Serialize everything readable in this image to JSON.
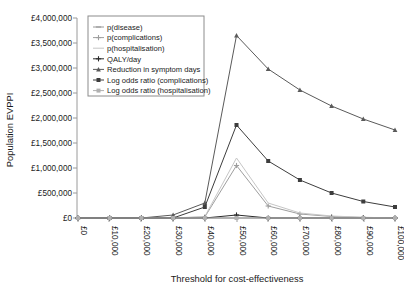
{
  "chart_data": {
    "type": "line",
    "title": "",
    "xlabel": "Threshold for cost-effectiveness",
    "ylabel": "Population EVPPI",
    "x": [
      0,
      10000,
      20000,
      30000,
      40000,
      50000,
      60000,
      70000,
      80000,
      90000,
      100000
    ],
    "categories": [
      "£0",
      "£10,000",
      "£20,000",
      "£30,000",
      "£40,000",
      "£50,000",
      "£60,000",
      "£70,000",
      "£80,000",
      "£90,000",
      "£100,000"
    ],
    "xtick_labels": [
      "£0",
      "£10,000",
      "£20,000",
      "£30,000",
      "£40,000",
      "£50,000",
      "£60,000",
      "£70,000",
      "£80,000",
      "£90,000",
      "£100,000"
    ],
    "ytick_labels": [
      "£0",
      "£500,000",
      "£1,000,000",
      "£1,500,000",
      "£2,000,000",
      "£2,500,000",
      "£3,000,000",
      "£3,500,000",
      "£4,000,000"
    ],
    "ytick_values": [
      0,
      500000,
      1000000,
      1500000,
      2000000,
      2500000,
      3000000,
      3500000,
      4000000
    ],
    "ylim": [
      0,
      4000000
    ],
    "xlim": [
      0,
      100000
    ],
    "grid": false,
    "legend_position": "upper-left-inside",
    "x_tick_label_rotation": 90,
    "series": [
      {
        "name": "p(disease)",
        "color": "#9a9a9a",
        "marker": "dash",
        "values": [
          0,
          0,
          0,
          0,
          0,
          0,
          0,
          0,
          0,
          0,
          0
        ]
      },
      {
        "name": "p(complications)",
        "color": "#9e9e9e",
        "marker": "plus",
        "values": [
          0,
          0,
          0,
          0,
          20000,
          1050000,
          240000,
          80000,
          30000,
          10000,
          0
        ]
      },
      {
        "name": "p(hospitalisation)",
        "color": "#c6c6c6",
        "marker": "none",
        "values": [
          0,
          0,
          0,
          0,
          30000,
          1200000,
          300000,
          100000,
          40000,
          15000,
          0
        ]
      },
      {
        "name": "QALY/day",
        "color": "#2b2b2b",
        "marker": "plus",
        "values": [
          0,
          0,
          0,
          0,
          0,
          60000,
          0,
          0,
          0,
          0,
          0
        ]
      },
      {
        "name": "Reduction in symptom days",
        "color": "#5a5a5a",
        "marker": "triangle",
        "values": [
          0,
          0,
          0,
          60000,
          300000,
          3650000,
          2980000,
          2560000,
          2240000,
          1980000,
          1760000
        ]
      },
      {
        "name": "Log odds ratio (complications)",
        "color": "#3d3d3d",
        "marker": "square",
        "values": [
          0,
          0,
          0,
          0,
          220000,
          1860000,
          1140000,
          760000,
          500000,
          330000,
          220000
        ]
      },
      {
        "name": "Log odds ratio (hospitalisation)",
        "color": "#b0b0b0",
        "marker": "square",
        "values": [
          0,
          0,
          0,
          0,
          0,
          0,
          0,
          0,
          0,
          0,
          0
        ]
      }
    ]
  }
}
